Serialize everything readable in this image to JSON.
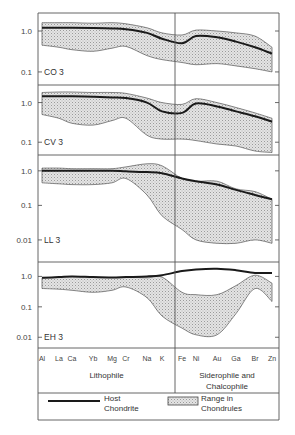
{
  "chart_data": {
    "type": "area",
    "title": "",
    "ylabel": "",
    "xlabel": "",
    "y_scale": "log",
    "x_categories": [
      "Al",
      "La",
      "Ca",
      "Yb",
      "Mg",
      "Cr",
      "Na",
      "K",
      "Fe",
      "Ni",
      "Au",
      "Ga",
      "Br",
      "Zn"
    ],
    "x_groups": [
      {
        "label_lines": [
          "Lithophile"
        ],
        "members": [
          "Al",
          "La",
          "Ca",
          "Yb",
          "Mg",
          "Cr",
          "Na",
          "K"
        ]
      },
      {
        "label_lines": [
          "Siderophile and",
          "Chalcophile"
        ],
        "members": [
          "Fe",
          "Ni",
          "Au",
          "Ga",
          "Br",
          "Zn"
        ]
      }
    ],
    "legend": {
      "host": "Host Chondrite",
      "host_lines": [
        "Host",
        "Chondrite"
      ],
      "range": "Range in Chondrules",
      "range_lines": [
        "Range in",
        "Chondrules"
      ]
    },
    "panels": [
      {
        "name": "CO 3",
        "ylim": [
          0.06,
          2.2
        ],
        "yticks": [
          {
            "v": 1.0,
            "label": "1.0"
          },
          {
            "v": 0.1,
            "label": "0.1"
          }
        ],
        "host": [
          1.2,
          1.2,
          1.2,
          1.18,
          1.15,
          1.1,
          0.9,
          0.65,
          0.5,
          0.75,
          0.7,
          0.55,
          0.4,
          0.28
        ],
        "range_upper": [
          1.6,
          1.6,
          1.6,
          1.55,
          1.6,
          1.5,
          1.2,
          0.9,
          0.8,
          1.05,
          1.0,
          0.9,
          0.75,
          0.4
        ],
        "range_lower": [
          0.45,
          0.4,
          0.35,
          0.32,
          0.38,
          0.42,
          0.25,
          0.2,
          0.17,
          0.15,
          0.16,
          0.14,
          0.12,
          0.1
        ]
      },
      {
        "name": "CV 3",
        "ylim": [
          0.06,
          2.2
        ],
        "yticks": [
          {
            "v": 1.0,
            "label": "1.0"
          },
          {
            "v": 0.1,
            "label": "0.1"
          }
        ],
        "host": [
          1.45,
          1.45,
          1.45,
          1.4,
          1.35,
          1.3,
          1.0,
          0.6,
          0.55,
          0.95,
          0.8,
          0.6,
          0.45,
          0.33
        ],
        "range_upper": [
          1.8,
          1.85,
          1.85,
          1.8,
          1.8,
          1.7,
          1.3,
          1.0,
          0.9,
          1.25,
          1.0,
          0.75,
          0.55,
          0.4
        ],
        "range_lower": [
          0.5,
          0.4,
          0.3,
          0.27,
          0.35,
          0.4,
          0.15,
          0.12,
          0.12,
          0.11,
          0.09,
          0.08,
          0.06,
          0.055
        ]
      },
      {
        "name": "LL 3",
        "ylim": [
          0.003,
          2.2
        ],
        "yticks": [
          {
            "v": 1.0,
            "label": "1.0"
          },
          {
            "v": 0.1,
            "label": "0.1"
          },
          {
            "v": 0.01,
            "label": "0.01"
          }
        ],
        "host": [
          1.0,
          1.0,
          1.0,
          1.0,
          1.0,
          0.97,
          0.92,
          0.85,
          0.6,
          0.5,
          0.4,
          0.28,
          0.2,
          0.15
        ],
        "range_upper": [
          1.2,
          1.2,
          1.15,
          1.15,
          1.15,
          1.3,
          1.6,
          1.4,
          0.6,
          0.5,
          0.5,
          0.3,
          0.25,
          0.15
        ],
        "range_lower": [
          0.45,
          0.42,
          0.4,
          0.4,
          0.45,
          0.6,
          0.2,
          0.05,
          0.02,
          0.01,
          0.008,
          0.008,
          0.01,
          0.008
        ]
      },
      {
        "name": "EH 3",
        "ylim": [
          0.006,
          2.2
        ],
        "yticks": [
          {
            "v": 1.0,
            "label": "1.0"
          },
          {
            "v": 0.1,
            "label": "0.1"
          },
          {
            "v": 0.01,
            "label": "0.01"
          }
        ],
        "host": [
          0.9,
          0.95,
          1.0,
          0.95,
          0.92,
          0.95,
          1.0,
          1.1,
          1.5,
          1.7,
          1.8,
          1.6,
          1.3,
          1.3
        ],
        "range_upper": [
          0.9,
          0.95,
          1.0,
          0.95,
          0.92,
          0.95,
          0.9,
          0.95,
          0.3,
          0.25,
          0.25,
          0.5,
          1.1,
          0.6
        ],
        "range_lower": [
          0.4,
          0.38,
          0.35,
          0.3,
          0.35,
          0.45,
          0.2,
          0.05,
          0.02,
          0.012,
          0.012,
          0.06,
          0.4,
          0.15
        ]
      }
    ]
  }
}
